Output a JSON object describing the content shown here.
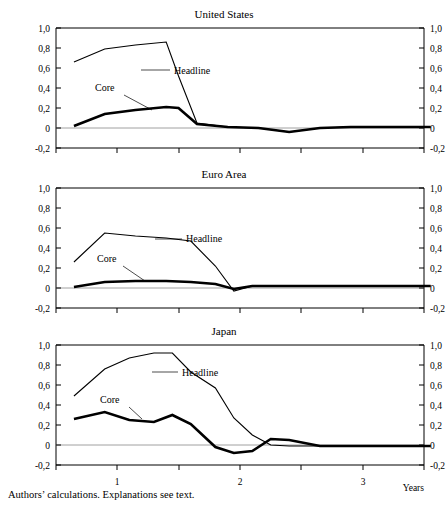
{
  "footnote": "Authors’ calculations. Explanations see text.",
  "axis": {
    "y_ticks": [
      "1,0",
      "0,8",
      "0,6",
      "0,4",
      "0,2",
      "0",
      "-0,2"
    ],
    "y_tick_values": [
      1.0,
      0.8,
      0.6,
      0.4,
      0.2,
      0.0,
      -0.2
    ],
    "x_ticks": [
      "1",
      "2",
      "3"
    ],
    "x_tick_values": [
      1,
      2,
      3
    ],
    "x_axis_label": "Years"
  },
  "labels": {
    "headline": "Headline",
    "core": "Core"
  },
  "chart_data": [
    {
      "type": "line",
      "title": "United States",
      "xlabel": "",
      "ylabel": "",
      "xlim": [
        0.6,
        3.6
      ],
      "ylim": [
        -0.2,
        1.0
      ],
      "grid": false,
      "legend": "inline-annotations",
      "series": [
        {
          "name": "Headline",
          "x": [
            0.65,
            0.9,
            1.15,
            1.4,
            1.5,
            1.65,
            1.9,
            2.15,
            2.4,
            2.65,
            2.9,
            3.15,
            3.4,
            3.55
          ],
          "values": [
            0.66,
            0.79,
            0.83,
            0.86,
            0.52,
            0.05,
            0.01,
            0.0,
            -0.04,
            0.0,
            0.01,
            0.01,
            0.01,
            0.01
          ]
        },
        {
          "name": "Core",
          "x": [
            0.65,
            0.9,
            1.15,
            1.4,
            1.5,
            1.65,
            1.9,
            2.15,
            2.4,
            2.65,
            2.9,
            3.15,
            3.4,
            3.55
          ],
          "values": [
            0.02,
            0.14,
            0.18,
            0.21,
            0.2,
            0.04,
            0.01,
            0.0,
            -0.04,
            0.0,
            0.01,
            0.01,
            0.01,
            0.01
          ]
        }
      ]
    },
    {
      "type": "line",
      "title": "Euro Area",
      "xlabel": "",
      "ylabel": "",
      "xlim": [
        0.6,
        3.6
      ],
      "ylim": [
        -0.2,
        1.0
      ],
      "grid": false,
      "legend": "inline-annotations",
      "series": [
        {
          "name": "Headline",
          "x": [
            0.65,
            0.9,
            1.15,
            1.4,
            1.6,
            1.8,
            1.95,
            2.1,
            2.4,
            2.65,
            2.9,
            3.15,
            3.4,
            3.55
          ],
          "values": [
            0.26,
            0.55,
            0.52,
            0.5,
            0.47,
            0.22,
            -0.03,
            0.02,
            0.02,
            0.02,
            0.02,
            0.02,
            0.02,
            0.02
          ]
        },
        {
          "name": "Core",
          "x": [
            0.65,
            0.9,
            1.15,
            1.4,
            1.6,
            1.8,
            1.95,
            2.1,
            2.4,
            2.65,
            2.9,
            3.15,
            3.4,
            3.55
          ],
          "values": [
            0.01,
            0.06,
            0.07,
            0.07,
            0.06,
            0.04,
            -0.01,
            0.02,
            0.02,
            0.02,
            0.02,
            0.02,
            0.02,
            0.02
          ]
        }
      ]
    },
    {
      "type": "line",
      "title": "Japan",
      "xlabel": "",
      "ylabel": "",
      "xlim": [
        0.6,
        3.6
      ],
      "ylim": [
        -0.2,
        1.0
      ],
      "grid": false,
      "legend": "inline-annotations",
      "series": [
        {
          "name": "Headline",
          "x": [
            0.65,
            0.9,
            1.1,
            1.3,
            1.45,
            1.6,
            1.8,
            1.95,
            2.1,
            2.25,
            2.4,
            2.65,
            2.9,
            3.15,
            3.4,
            3.55
          ],
          "values": [
            0.49,
            0.76,
            0.87,
            0.92,
            0.92,
            0.73,
            0.57,
            0.27,
            0.1,
            0.0,
            -0.01,
            -0.01,
            -0.01,
            -0.01,
            -0.01,
            -0.01
          ]
        },
        {
          "name": "Core",
          "x": [
            0.65,
            0.9,
            1.1,
            1.3,
            1.45,
            1.6,
            1.8,
            1.95,
            2.1,
            2.25,
            2.4,
            2.65,
            2.9,
            3.15,
            3.4,
            3.55
          ],
          "values": [
            0.26,
            0.33,
            0.25,
            0.23,
            0.3,
            0.21,
            -0.02,
            -0.08,
            -0.06,
            0.06,
            0.05,
            -0.01,
            -0.01,
            -0.01,
            -0.01,
            -0.01
          ]
        }
      ]
    }
  ]
}
